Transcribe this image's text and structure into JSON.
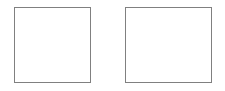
{
  "canvas": {
    "width": 225,
    "height": 91,
    "background_color": "#ffffff",
    "description": "Two empty rectangular outlines side by side on a white background"
  },
  "shapes": [
    {
      "name": "left-rectangle",
      "kind": "rectangle",
      "x": 14,
      "y": 7,
      "width": 77,
      "height": 76,
      "border_color": "#808080",
      "border_width": 1,
      "fill_color": "#ffffff",
      "content": ""
    },
    {
      "name": "right-rectangle",
      "kind": "rectangle",
      "x": 125,
      "y": 7,
      "width": 87,
      "height": 76,
      "border_color": "#808080",
      "border_width": 1,
      "fill_color": "#ffffff",
      "content": ""
    }
  ]
}
